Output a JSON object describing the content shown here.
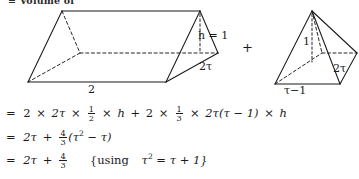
{
  "caption": {
    "text": "= Volume of"
  },
  "figures": {
    "prism": {
      "name": "triangular-prism",
      "labels": {
        "height": "h = 1",
        "slant": "2τ",
        "base": "2"
      }
    },
    "operator": "+",
    "pyramid": {
      "name": "square-pyramid",
      "labels": {
        "height": "1",
        "slant": "2τ",
        "base": "τ−1"
      }
    }
  },
  "equations": {
    "line1": {
      "eq": "=",
      "t1_a": "2",
      "t1_mul1": "×",
      "t1_b": "2τ",
      "t1_mul2": "×",
      "frac1_num": "1",
      "frac1_den": "2",
      "t1_mul3": "×",
      "t1_h": "h",
      "plus": "+",
      "t2_a": "2",
      "t2_mul1": "×",
      "frac2_num": "1",
      "frac2_den": "3",
      "t2_mul2": "×",
      "t2_b": "2τ(τ − 1)",
      "t2_mul3": "×",
      "t2_h": "h"
    },
    "line2": {
      "eq": "=",
      "a": "2τ",
      "plus": "+",
      "frac_num": "4",
      "frac_den": "3",
      "b": "(τ",
      "pow": "2",
      "c": "− τ)"
    },
    "line3": {
      "eq": "=",
      "a": "2τ",
      "plus": "+",
      "frac_num": "4",
      "frac_den": "3",
      "note_open": "{using",
      "note_tau": "τ",
      "note_pow": "2",
      "note_rest": "= τ + 1}"
    }
  },
  "style": {
    "ink": "#1a1a1a",
    "paper": "#ffffff"
  }
}
